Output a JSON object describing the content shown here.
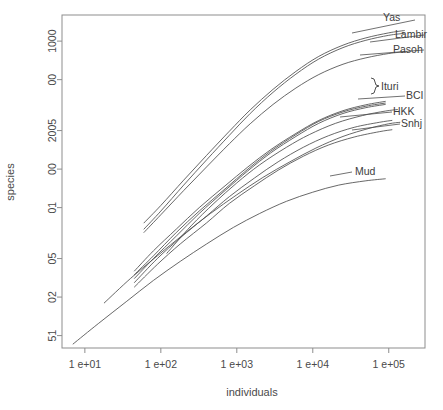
{
  "chart_data": {
    "type": "line",
    "title": "",
    "xlabel": "individuals",
    "ylabel": "species",
    "x_scale": "log",
    "y_scale": "log",
    "grid": false,
    "legend_position": "right-inline-labels",
    "xlim": [
      5,
      300000
    ],
    "ylim": [
      4,
      1600
    ],
    "x_ticks": [
      {
        "value": 10,
        "label": "1 e+01"
      },
      {
        "value": 100,
        "label": "1 e+02"
      },
      {
        "value": 1000,
        "label": "1 e+03"
      },
      {
        "value": 10000,
        "label": "1 e+04"
      },
      {
        "value": 100000,
        "label": "1 e+05"
      }
    ],
    "y_ticks": [
      {
        "value": 1000,
        "label": "1000"
      },
      {
        "value": 500,
        "label": "00"
      },
      {
        "value": 200,
        "label": "2005"
      },
      {
        "value": 100,
        "label": "00"
      },
      {
        "value": 50,
        "label": "01"
      },
      {
        "value": 20,
        "label": "05"
      },
      {
        "value": 10,
        "label": "02"
      },
      {
        "value": 5,
        "label": "51"
      }
    ],
    "series": [
      {
        "name": "Yas",
        "label": "Yas",
        "points": [
          [
            60,
            38
          ],
          [
            100,
            52
          ],
          [
            200,
            82
          ],
          [
            400,
            128
          ],
          [
            800,
            198
          ],
          [
            1500,
            290
          ],
          [
            3000,
            420
          ],
          [
            6000,
            580
          ],
          [
            12000,
            760
          ],
          [
            25000,
            930
          ],
          [
            50000,
            1060
          ],
          [
            100000,
            1160
          ],
          [
            160000,
            1210
          ]
        ]
      },
      {
        "name": "Lambir",
        "label": "Lambir",
        "points": [
          [
            60,
            34
          ],
          [
            100,
            47
          ],
          [
            200,
            75
          ],
          [
            400,
            118
          ],
          [
            800,
            184
          ],
          [
            1500,
            272
          ],
          [
            3000,
            398
          ],
          [
            6000,
            552
          ],
          [
            12000,
            725
          ],
          [
            25000,
            890
          ],
          [
            50000,
            1015
          ],
          [
            100000,
            1110
          ],
          [
            160000,
            1150
          ]
        ]
      },
      {
        "name": "Pasoh",
        "label": "Pasoh",
        "points": [
          [
            60,
            32
          ],
          [
            100,
            44
          ],
          [
            200,
            68
          ],
          [
            400,
            104
          ],
          [
            800,
            158
          ],
          [
            1500,
            226
          ],
          [
            3000,
            320
          ],
          [
            6000,
            430
          ],
          [
            12000,
            548
          ],
          [
            25000,
            660
          ],
          [
            50000,
            740
          ],
          [
            100000,
            800
          ],
          [
            160000,
            825
          ]
        ]
      },
      {
        "name": "Ituri",
        "label": "Ituri",
        "points": [
          [
            45,
            16
          ],
          [
            80,
            23
          ],
          [
            160,
            34
          ],
          [
            320,
            50
          ],
          [
            700,
            74
          ],
          [
            1400,
            104
          ],
          [
            2800,
            142
          ],
          [
            6000,
            190
          ],
          [
            12000,
            240
          ],
          [
            25000,
            286
          ],
          [
            50000,
            318
          ],
          [
            90000,
            338
          ]
        ]
      },
      {
        "name": "Ituri-2",
        "label": "",
        "points": [
          [
            45,
            15
          ],
          [
            80,
            21
          ],
          [
            160,
            32
          ],
          [
            320,
            47
          ],
          [
            700,
            70
          ],
          [
            1400,
            100
          ],
          [
            2800,
            138
          ],
          [
            6000,
            186
          ],
          [
            12000,
            236
          ],
          [
            25000,
            280
          ],
          [
            50000,
            310
          ],
          [
            90000,
            328
          ]
        ]
      },
      {
        "name": "Ituri-3",
        "label": "",
        "points": [
          [
            45,
            14
          ],
          [
            80,
            20
          ],
          [
            160,
            30
          ],
          [
            320,
            45
          ],
          [
            700,
            68
          ],
          [
            1400,
            97
          ],
          [
            2800,
            134
          ],
          [
            6000,
            180
          ],
          [
            12000,
            228
          ],
          [
            25000,
            272
          ],
          [
            50000,
            302
          ],
          [
            90000,
            320
          ]
        ]
      },
      {
        "name": "BCI",
        "label": "BCI",
        "points": [
          [
            120,
            22
          ],
          [
            250,
            36
          ],
          [
            500,
            54
          ],
          [
            1000,
            78
          ],
          [
            2000,
            108
          ],
          [
            4500,
            148
          ],
          [
            9000,
            186
          ],
          [
            20000,
            228
          ],
          [
            45000,
            262
          ],
          [
            90000,
            284
          ],
          [
            130000,
            292
          ]
        ]
      },
      {
        "name": "HKK",
        "label": "HKK",
        "points": [
          [
            45,
            13
          ],
          [
            90,
            20
          ],
          [
            180,
            29
          ],
          [
            400,
            43
          ],
          [
            800,
            61
          ],
          [
            1700,
            85
          ],
          [
            3500,
            114
          ],
          [
            7500,
            148
          ],
          [
            16000,
            182
          ],
          [
            35000,
            212
          ],
          [
            75000,
            232
          ],
          [
            110000,
            240
          ]
        ]
      },
      {
        "name": "Snhj",
        "label": "Snhj",
        "points": [
          [
            45,
            12
          ],
          [
            90,
            18
          ],
          [
            180,
            26
          ],
          [
            400,
            38
          ],
          [
            800,
            54
          ],
          [
            1700,
            74
          ],
          [
            3500,
            98
          ],
          [
            7500,
            126
          ],
          [
            16000,
            154
          ],
          [
            35000,
            178
          ],
          [
            75000,
            196
          ],
          [
            110000,
            203
          ]
        ]
      },
      {
        "name": "Mud",
        "label": "Mud",
        "points": [
          [
            7,
            4.3
          ],
          [
            15,
            6.2
          ],
          [
            35,
            9.2
          ],
          [
            80,
            13.5
          ],
          [
            180,
            19
          ],
          [
            400,
            26
          ],
          [
            900,
            35
          ],
          [
            2000,
            45
          ],
          [
            4500,
            56
          ],
          [
            10000,
            66
          ],
          [
            22000,
            75
          ],
          [
            50000,
            81
          ],
          [
            90000,
            84
          ]
        ]
      },
      {
        "name": "unlabeled-steep",
        "label": "",
        "points": [
          [
            18,
            9
          ],
          [
            40,
            14
          ],
          [
            90,
            21
          ],
          [
            200,
            31
          ],
          [
            450,
            45
          ],
          [
            1000,
            63
          ],
          [
            2200,
            86
          ],
          [
            5000,
            114
          ],
          [
            11000,
            146
          ],
          [
            25000,
            180
          ],
          [
            55000,
            208
          ],
          [
            100000,
            226
          ],
          [
            140000,
            232
          ]
        ]
      }
    ]
  },
  "labels": {
    "yas": "Yas",
    "lambir": "Lambir",
    "pasoh": "Pasoh",
    "ituri": "Ituri",
    "bci": "BCI",
    "hkk": "HKK",
    "snhj": "Snhj",
    "mud": "Mud"
  },
  "axes": {
    "x_title": "individuals",
    "y_title": "species",
    "x_tick_labels": [
      "1 e+01",
      "1 e+02",
      "1 e+03",
      "1 e+04",
      "1 e+05"
    ],
    "y_tick_labels": [
      "1000",
      "00",
      "2005",
      "00",
      "01",
      "05",
      "02",
      "51"
    ]
  },
  "colors": {
    "axis": "#8d8d8d",
    "curve": "#4d4d4d",
    "text": "#4a4a4a",
    "background": "#ffffff"
  }
}
